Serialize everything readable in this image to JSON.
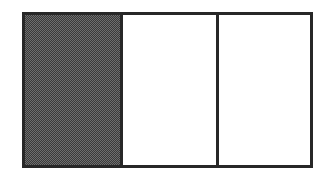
{
  "figure": {
    "canvas": {
      "width_px": 333,
      "height_px": 180,
      "background_color": "#ffffff"
    },
    "frame": {
      "name": "outer-rectangle",
      "border_color": "#272727",
      "border_width_px": 3,
      "left_px": 22,
      "top_px": 12,
      "width_px": 291,
      "height_px": 156
    },
    "panels": [
      {
        "id": "left",
        "label": "",
        "fill": "shaded",
        "fill_color": "#6e6e6e",
        "pattern": "halftone-dither-checkerboard",
        "width_px": 95
      },
      {
        "id": "middle",
        "label": "",
        "fill": "blank",
        "fill_color": "#ffffff",
        "pattern": "none",
        "width_px": 93
      },
      {
        "id": "right",
        "label": "",
        "fill": "blank",
        "fill_color": "#ffffff",
        "pattern": "none",
        "width_px": 94
      }
    ],
    "dividers": [
      {
        "id": "divider-1",
        "color": "#272727",
        "width_px": 3,
        "x_px": 120
      },
      {
        "id": "divider-2",
        "color": "#272727",
        "width_px": 3,
        "x_px": 215
      }
    ]
  }
}
